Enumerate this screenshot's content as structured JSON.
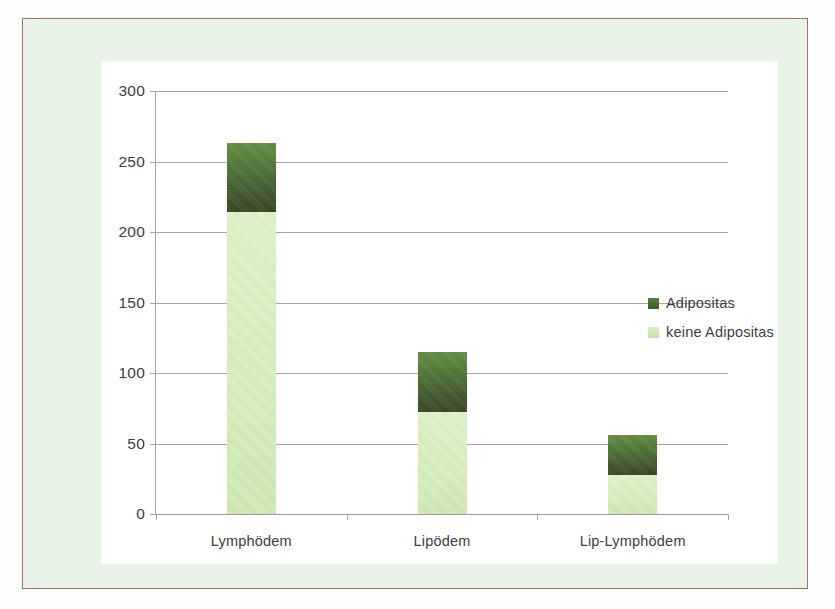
{
  "chart_data": {
    "type": "bar",
    "subtype": "stacked",
    "title": "",
    "xlabel": "",
    "ylabel": "",
    "categories": [
      "Lymphödem",
      "Lipödem",
      "Lip-Lymphödem"
    ],
    "series": [
      {
        "name": "keine Adipositas",
        "color": "#cfe9b2",
        "values": [
          214,
          72,
          28
        ]
      },
      {
        "name": "Adipositas",
        "color": "#42592a",
        "values": [
          49,
          43,
          28
        ]
      }
    ],
    "totals": [
      263,
      115,
      56
    ],
    "ylim": [
      0,
      300
    ],
    "yticks": [
      0,
      50,
      100,
      150,
      200,
      250,
      300
    ],
    "ytick_labels": [
      "0",
      "50",
      "100",
      "150",
      "200",
      "250",
      "300"
    ],
    "grid": true,
    "legend_position": "right",
    "legend_entries": [
      {
        "label": "Adipositas",
        "swatch": "dark"
      },
      {
        "label": "keine Adipositas",
        "swatch": "light"
      }
    ],
    "colors": {
      "bar_dark": "#42592a",
      "bar_light": "#cfe9b2",
      "gridline": "#a6a6a6",
      "panel_background": "#ffffff",
      "page_background": "#e9f2e6",
      "frame_border": "#a8705f",
      "text": "#3d3d3d"
    }
  }
}
